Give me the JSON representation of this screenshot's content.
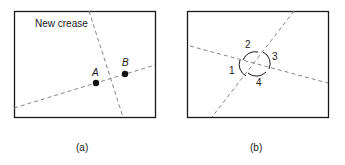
{
  "panel_a": {
    "caption": "(a)",
    "annotation": "New crease",
    "point_a": "A",
    "point_b": "B"
  },
  "panel_b": {
    "caption": "(b)",
    "angle_labels": [
      "1",
      "2",
      "3",
      "4"
    ]
  },
  "colors": {
    "stroke": "#1a1a1a",
    "dashed": "#777777"
  }
}
